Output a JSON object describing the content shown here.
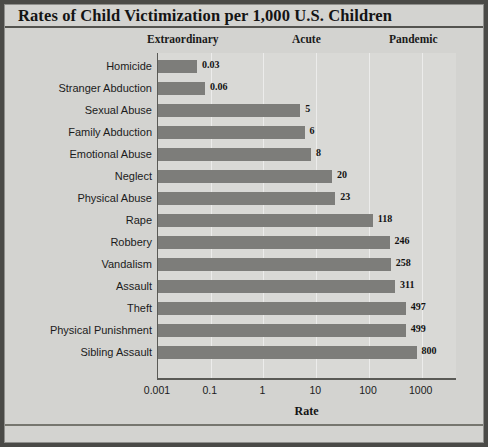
{
  "chart_data": {
    "type": "bar",
    "orientation": "horizontal",
    "title": "Rates of Child Victimization per 1,000 U.S. Children",
    "xlabel": "Rate",
    "ylabel": "",
    "xscale": "log",
    "xlim": [
      0.001,
      1000
    ],
    "grid": true,
    "legend": "none",
    "tick_labels": [
      "0.001",
      "0.1",
      "1",
      "10",
      "100",
      "1000"
    ],
    "tick_values": [
      0.001,
      0.1,
      1,
      10,
      100,
      1000
    ],
    "categories": [
      "Homicide",
      "Stranger Abduction",
      "Sexual Abuse",
      "Family Abduction",
      "Emotional Abuse",
      "Neglect",
      "Physical Abuse",
      "Rape",
      "Robbery",
      "Vandalism",
      "Assault",
      "Theft",
      "Physical Punishment",
      "Sibling Assault"
    ],
    "values": [
      0.03,
      0.06,
      5,
      6,
      8,
      20,
      23,
      118,
      246,
      258,
      311,
      497,
      499,
      800
    ],
    "value_labels": [
      "0.03",
      "0.06",
      "5",
      "6",
      "8",
      "20",
      "23",
      "118",
      "246",
      "258",
      "311",
      "497",
      "499",
      "800"
    ],
    "annotations": [
      {
        "name": "extraordinary",
        "label": "Extraordinary"
      },
      {
        "name": "acute",
        "label": "Acute"
      },
      {
        "name": "pandemic",
        "label": "Pandemic"
      }
    ],
    "colors": {
      "bar": "#7d7d7a",
      "plot_background": "#d9d9d6",
      "panel_background": "#d3d3d0",
      "frame": "#4a4a47",
      "gridline": "#ececeb",
      "text": "#1b1b1b"
    }
  }
}
